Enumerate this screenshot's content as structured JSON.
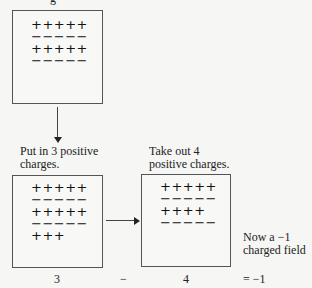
{
  "top_fragment": "g",
  "boxes": {
    "initial": {
      "rows": [
        "+++++",
        "−−−−−",
        "+++++",
        "−−−−−"
      ]
    },
    "added": {
      "caption_line1": "Put in 3 positive",
      "caption_line2": "charges.",
      "rows": [
        "+++++",
        "−−−−−",
        "+++++",
        "−−−−−",
        "+++"
      ],
      "value": "3"
    },
    "removed": {
      "caption_line1": "Take out 4",
      "caption_line2": "positive charges.",
      "rows": [
        "+++++",
        "−−−−−",
        "++++",
        "−−−−−"
      ],
      "value": "4"
    }
  },
  "operator": "−",
  "result": {
    "note_line1": "Now a −1",
    "note_line2": "charged field",
    "equation": "= −1"
  }
}
